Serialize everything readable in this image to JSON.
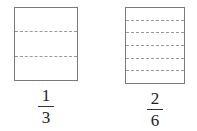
{
  "figure": {
    "type": "equivalent-fractions-area-model",
    "background_color": "#ffffff",
    "border_color": "#7a7a7a",
    "divider_color": "#9a9a9a",
    "text_color": "#222222"
  },
  "models": [
    {
      "id": "left",
      "name": "one-third-rectangle",
      "parts_total": 3,
      "divider_count": 2,
      "shaded_parts": 0,
      "fraction": {
        "numerator": "1",
        "denominator": "3",
        "text": "1/3"
      }
    },
    {
      "id": "right",
      "name": "two-sixths-rectangle",
      "parts_total": 6,
      "divider_count": 5,
      "shaded_parts": 0,
      "fraction": {
        "numerator": "2",
        "denominator": "6",
        "text": "2/6"
      }
    }
  ],
  "chart_data": {
    "type": "bar",
    "title": "",
    "xlabel": "",
    "ylabel": "",
    "categories": [
      "1/3",
      "2/6"
    ],
    "values": [
      3,
      6
    ],
    "series": [
      {
        "name": "equal parts per whole",
        "values": [
          3,
          6
        ]
      }
    ],
    "grid": false,
    "legend": "none"
  }
}
